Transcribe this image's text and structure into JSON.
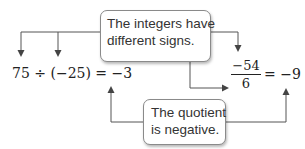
{
  "callouts": {
    "top": {
      "line1": "The integers have",
      "line2": "different signs."
    },
    "bottom": {
      "line1": "The quotient",
      "line2": "is negative."
    }
  },
  "examples": {
    "division": {
      "expression": "75 ÷ (−25) = −3"
    },
    "fraction": {
      "numerator": "−54",
      "denominator": "6",
      "result": "= −9"
    }
  },
  "colors": {
    "line": "#555555",
    "box_border": "#8a8a8a",
    "text": "#222222"
  }
}
